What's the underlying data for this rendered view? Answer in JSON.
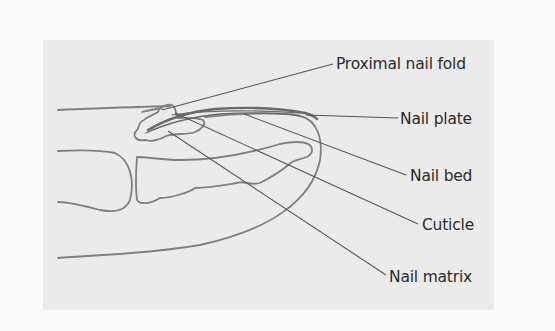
{
  "diagram": {
    "type": "anatomical-cross-section",
    "colors": {
      "page_background": "#fbfbfb",
      "panel_background": "#ebebeb",
      "outline_stroke": "#808080",
      "leader_stroke": "#555555",
      "label_text": "#2a2a2a"
    },
    "labels": [
      {
        "id": "proximal-nail-fold",
        "text": "Proximal nail fold"
      },
      {
        "id": "nail-plate",
        "text": "Nail plate"
      },
      {
        "id": "nail-bed",
        "text": "Nail bed"
      },
      {
        "id": "cuticle",
        "text": "Cuticle"
      },
      {
        "id": "nail-matrix",
        "text": "Nail matrix"
      }
    ]
  }
}
